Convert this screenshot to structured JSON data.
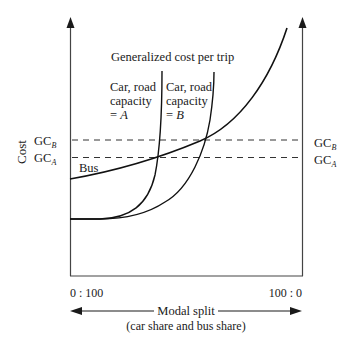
{
  "diagram": {
    "title": "Generalized cost per trip",
    "y_axis_label": "Cost",
    "x_axis": {
      "left_label": "0 : 100",
      "right_label": "100 : 0",
      "title": "Modal split",
      "subtitle": "(car share and bus share)"
    },
    "left_levels": {
      "gc_b": {
        "main": "GC",
        "sub": "B"
      },
      "gc_a": {
        "main": "GC",
        "sub": "A"
      }
    },
    "right_levels": {
      "gc_b": {
        "main": "GC",
        "sub": "B"
      },
      "gc_a": {
        "main": "GC",
        "sub": "A"
      }
    },
    "curves": {
      "bus": {
        "label": "Bus"
      },
      "car_a": {
        "line1": "Car, road",
        "line2": "capacity",
        "line3_prefix": "= ",
        "line3_var": "A"
      },
      "car_b": {
        "line1": "Car, road",
        "line2": "capacity",
        "line3_prefix": "= ",
        "line3_var": "B"
      }
    },
    "colors": {
      "ink": "#1a1a1a",
      "background": "#ffffff"
    }
  }
}
